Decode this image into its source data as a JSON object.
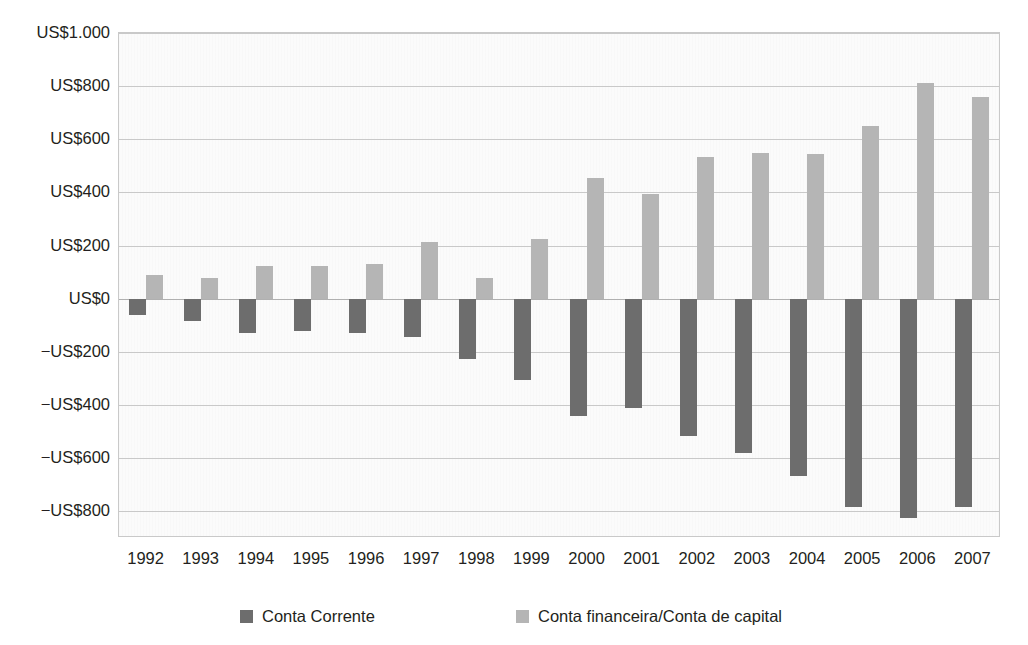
{
  "chart_data": {
    "type": "bar",
    "title": "",
    "subtitle": "",
    "xlabel": "",
    "ylabel": "",
    "grid": true,
    "legend_position": "bottom",
    "ylim": [
      -900,
      1000
    ],
    "y_ticks": [
      1000,
      800,
      600,
      400,
      200,
      0,
      -200,
      -400,
      -600,
      -800
    ],
    "y_tick_labels": [
      "US$1.000",
      "US$800",
      "US$600",
      "US$400",
      "US$200",
      "US$0",
      "−US$200",
      "−US$400",
      "−US$600",
      "−US$800"
    ],
    "categories": [
      "1992",
      "1993",
      "1994",
      "1995",
      "1996",
      "1997",
      "1998",
      "1999",
      "2000",
      "2001",
      "2002",
      "2003",
      "2004",
      "2005",
      "2006",
      "2007"
    ],
    "series": [
      {
        "name": "Conta Corrente",
        "color": "#6d6d6d",
        "values": [
          -60,
          -85,
          -130,
          -120,
          -130,
          -145,
          -225,
          -305,
          -440,
          -410,
          -515,
          -580,
          -665,
          -785,
          -825,
          -785
        ]
      },
      {
        "name": "Conta financeira/Conta de capital",
        "color": "#b5b5b5",
        "values": [
          90,
          80,
          125,
          125,
          130,
          215,
          80,
          225,
          455,
          395,
          533,
          550,
          545,
          650,
          812,
          760
        ]
      }
    ]
  },
  "legend": {
    "items": [
      {
        "label": "Conta Corrente",
        "color": "#6d6d6d"
      },
      {
        "label": "Conta financeira/Conta de capital",
        "color": "#b5b5b5"
      }
    ]
  }
}
